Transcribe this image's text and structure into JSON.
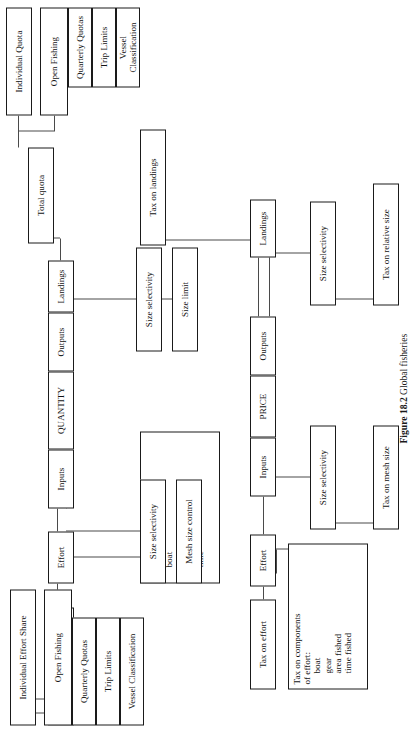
{
  "figure": {
    "number": "Figure 18.2",
    "title": "Global fisheries",
    "caption_full": "Figure 18.2  Global fisheries"
  },
  "price_branch": {
    "root": "PRICE",
    "inputs": "Inputs",
    "outputs": "Outputs",
    "landings": "Landings",
    "tax_on_landings": "Tax on landings",
    "size_selectivity_out": "Size selectivity",
    "tax_on_relative_size": "Tax on relative size",
    "effort": "Effort",
    "tax_on_effort": "Tax on effort",
    "tax_on_components": "Tax on components\nof effort:",
    "tax_components_list": "boat\ngear\narea fished\ntime fished",
    "size_selectivity_in": "Size selectivity",
    "tax_on_mesh_size": "Tax on mesh size"
  },
  "quantity_branch": {
    "root": "QUANTITY",
    "inputs": "Inputs",
    "outputs": "Outputs",
    "landings": "Landings",
    "total_quota": "Total quota",
    "individual_quota": "Individual Quota",
    "open_fishing": "Open Fishing",
    "quarterly_quotas": "Quarterly Quotas",
    "trip_limits": "Trip Limits",
    "vessel_classification": "Vessel Classification",
    "size_selectivity_out": "Size selectivity",
    "size_limit": "Size limit",
    "effort": "Effort",
    "total_effort_limit": "Total effort limit",
    "individual_effort_share": "Individual Effort Share",
    "open_fishing_2": "Open Fishing",
    "quarterly_quotas_2": "Quarterly Quotas",
    "trip_limits_2": "Trip Limits",
    "vessel_classification_2": "Vessel Classification",
    "restrictions_title": "Restrictions on\ncomponents of effort:",
    "restrictions_list": "boat\ngear\narea\ntime",
    "size_selectivity_in": "Size selectivity",
    "mesh_size_control": "Mesh size control"
  },
  "colors": {
    "ink": "#1a1a1a",
    "line": "#4a4a4a",
    "paper": "#ffffff"
  }
}
